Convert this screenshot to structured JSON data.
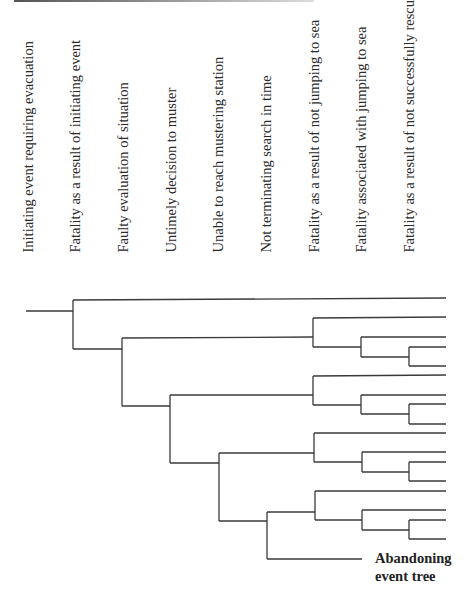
{
  "diagram": {
    "type": "event-tree",
    "title": "Abandoning event tree",
    "column_headers": [
      "Initiating event requiring evacuation",
      "Fatality as a result of initiating event",
      "Faulty evaluation of situation",
      "Untimely decision to muster",
      "Unable to reach mustering station",
      "Not terminating search in time",
      "Fatality as a result of not jumping to sea",
      "Fatality associated with jumping to sea",
      "Fatality as a result of not successfully rescued"
    ],
    "end_label_line1": "Abandoning",
    "end_label_line2": "event tree",
    "line_color": "#3a3a3a"
  }
}
